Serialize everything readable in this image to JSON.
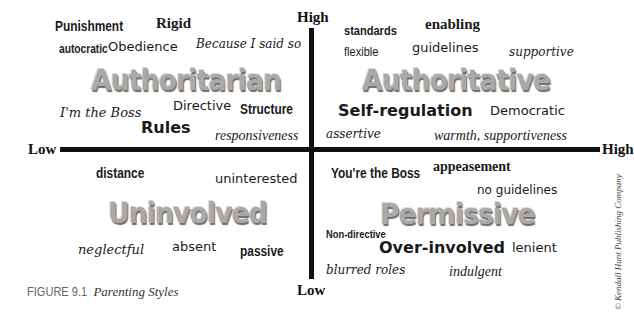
{
  "figure": {
    "number": "FIGURE 9.1",
    "title": "Parenting Styles",
    "copyright": "© Kendall Hunt Publishing Company"
  },
  "axes": {
    "vertical_top": "High",
    "vertical_bottom": "Low",
    "horizontal_left": "Low",
    "horizontal_right": "High"
  },
  "quadrants": {
    "authoritarian": {
      "title": "Authoritarian",
      "words": [
        "Punishment",
        "Rigid",
        "autocratic",
        "Obedience",
        "Because I said so",
        "I'm the Boss",
        "Directive",
        "Structure",
        "Rules",
        "responsiveness"
      ]
    },
    "authoritative": {
      "title": "Authoritative",
      "words": [
        "standards",
        "enabling",
        "flexible",
        "guidelines",
        "supportive",
        "Self-regulation",
        "Democratic",
        "assertive",
        "warmth, supportiveness"
      ]
    },
    "uninvolved": {
      "title": "Uninvolved",
      "words": [
        "distance",
        "uninterested",
        "neglectful",
        "absent",
        "passive"
      ]
    },
    "permissive": {
      "title": "Permissive",
      "words": [
        "You're the Boss",
        "appeasement",
        "no guidelines",
        "Non-directive",
        "Over-involved",
        "lenient",
        "blurred roles",
        "indulgent"
      ]
    }
  }
}
